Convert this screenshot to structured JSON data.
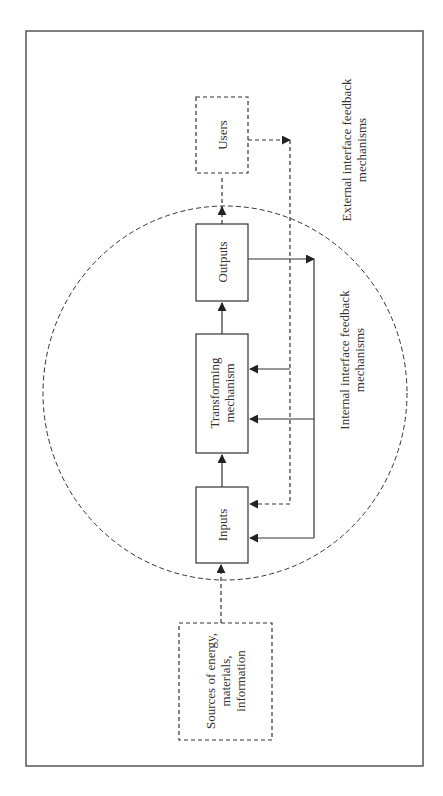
{
  "diagram": {
    "type": "system-feedback-flow",
    "orientation": "rotated -90deg",
    "colors": {
      "line": "#333333",
      "frame": "#555555",
      "background": "#ffffff"
    },
    "nodes": {
      "sources": {
        "label": "Sources of energy, materials, information",
        "lines": [
          "Sources of energy,",
          "materials,",
          "information"
        ],
        "style": "dashed"
      },
      "inputs": {
        "label": "Inputs",
        "style": "solid"
      },
      "transforming": {
        "label": "Transforming mechanism",
        "lines": [
          "Transforming",
          "mechanism"
        ],
        "style": "solid"
      },
      "outputs": {
        "label": "Outputs",
        "style": "solid"
      },
      "users": {
        "label": "Users",
        "style": "dashed"
      }
    },
    "boundary": {
      "shape": "ellipse",
      "style": "dashed"
    },
    "annotations": {
      "internal": {
        "lines": [
          "Internal interface feedback",
          "mechanisms"
        ]
      },
      "external": {
        "lines": [
          "External interface feedback",
          "mechanisms"
        ]
      }
    },
    "edges": [
      {
        "from": "sources",
        "to": "inputs",
        "style": "dashed"
      },
      {
        "from": "inputs",
        "to": "transforming",
        "style": "solid"
      },
      {
        "from": "transforming",
        "to": "outputs",
        "style": "solid"
      },
      {
        "from": "outputs",
        "to": "users",
        "style": "dashed"
      },
      {
        "from": "outputs",
        "to": "inputs",
        "style": "solid",
        "kind": "internal feedback"
      },
      {
        "from": "outputs",
        "to": "transforming",
        "style": "solid",
        "kind": "internal feedback"
      },
      {
        "from": "users",
        "to": "inputs",
        "style": "dashed",
        "kind": "external feedback"
      },
      {
        "from": "users",
        "to": "transforming",
        "style": "solid",
        "kind": "external feedback"
      }
    ]
  }
}
